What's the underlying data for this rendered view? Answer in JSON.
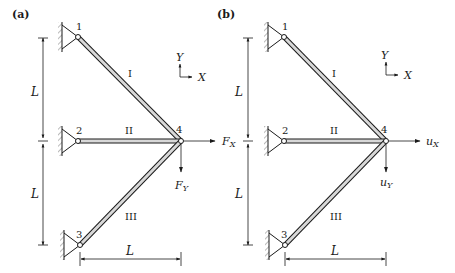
{
  "figure": {
    "panels": [
      {
        "id": "a",
        "label": "(a)",
        "nodes": [
          {
            "id": "1",
            "label": "1"
          },
          {
            "id": "2",
            "label": "2"
          },
          {
            "id": "3",
            "label": "3"
          },
          {
            "id": "4",
            "label": "4"
          }
        ],
        "members": [
          {
            "id": "I",
            "label": "I",
            "from": "1",
            "to": "4"
          },
          {
            "id": "II",
            "label": "II",
            "from": "2",
            "to": "4"
          },
          {
            "id": "III",
            "label": "III",
            "from": "3",
            "to": "4"
          }
        ],
        "dimensions": {
          "vertical_upper": "L",
          "vertical_lower": "L",
          "horizontal": "L"
        },
        "axes": {
          "y": "Y",
          "x": "X"
        },
        "load_x": {
          "main": "F",
          "sub": "X"
        },
        "load_y": {
          "main": "F",
          "sub": "Y"
        }
      },
      {
        "id": "b",
        "label": "(b)",
        "nodes": [
          {
            "id": "1",
            "label": "1"
          },
          {
            "id": "2",
            "label": "2"
          },
          {
            "id": "3",
            "label": "3"
          },
          {
            "id": "4",
            "label": "4"
          }
        ],
        "members": [
          {
            "id": "I",
            "label": "I",
            "from": "1",
            "to": "4"
          },
          {
            "id": "II",
            "label": "II",
            "from": "2",
            "to": "4"
          },
          {
            "id": "III",
            "label": "III",
            "from": "3",
            "to": "4"
          }
        ],
        "dimensions": {
          "vertical_upper": "L",
          "vertical_lower": "L",
          "horizontal": "L"
        },
        "axes": {
          "y": "Y",
          "x": "X"
        },
        "disp_x": {
          "main": "u",
          "sub": "X"
        },
        "disp_y": {
          "main": "u",
          "sub": "Y"
        }
      }
    ]
  }
}
